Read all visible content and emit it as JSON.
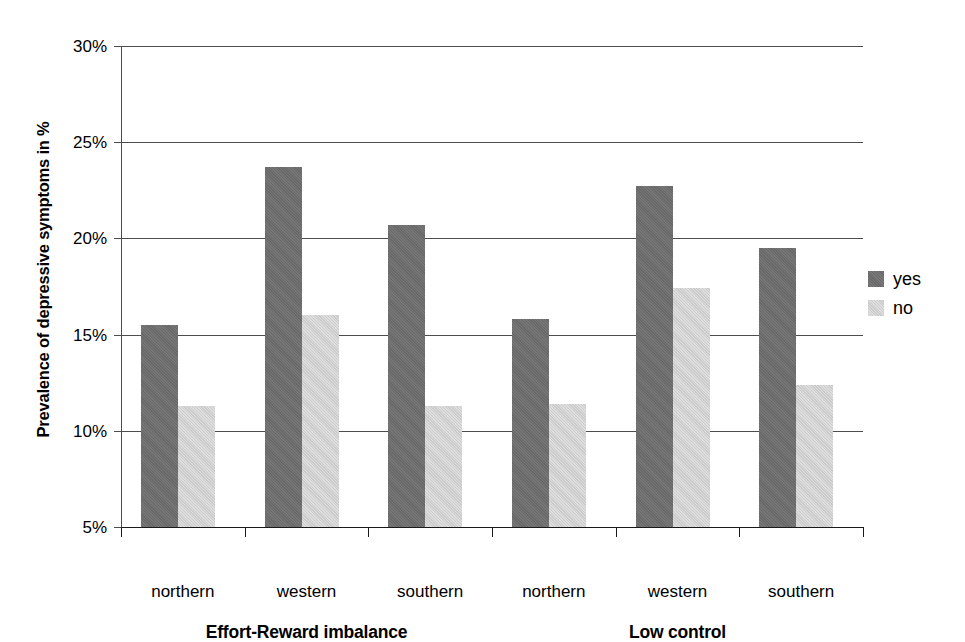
{
  "chart_data": {
    "type": "bar",
    "title": "",
    "subtitle": "",
    "xlabel": "",
    "ylabel": "Prevalence of depressive symptoms in %",
    "ylim": [
      5,
      30
    ],
    "ytick_labels": [
      "30%",
      "25%",
      "20%",
      "15%",
      "10%",
      "5%"
    ],
    "ytick_values": [
      30,
      25,
      20,
      15,
      10,
      5
    ],
    "grid": true,
    "grid_axis": "y",
    "legend_position": "right",
    "categories": [
      "northern",
      "western",
      "southern",
      "northern",
      "western",
      "southern"
    ],
    "panels": [
      {
        "label": "Effort-Reward imbalance",
        "categories": [
          "northern",
          "western",
          "southern"
        ]
      },
      {
        "label": "Low control",
        "categories": [
          "northern",
          "western",
          "southern"
        ]
      }
    ],
    "series": [
      {
        "name": "yes",
        "color": "#6e6e6e",
        "values": [
          15.5,
          23.7,
          20.7,
          15.8,
          22.7,
          19.5
        ]
      },
      {
        "name": "no",
        "color": "#d3d3d3",
        "values": [
          11.3,
          16.0,
          11.3,
          11.4,
          17.4,
          12.4
        ]
      }
    ]
  },
  "legend": {
    "items": [
      {
        "label": "yes",
        "series": "yes"
      },
      {
        "label": "no",
        "series": "no"
      }
    ]
  }
}
